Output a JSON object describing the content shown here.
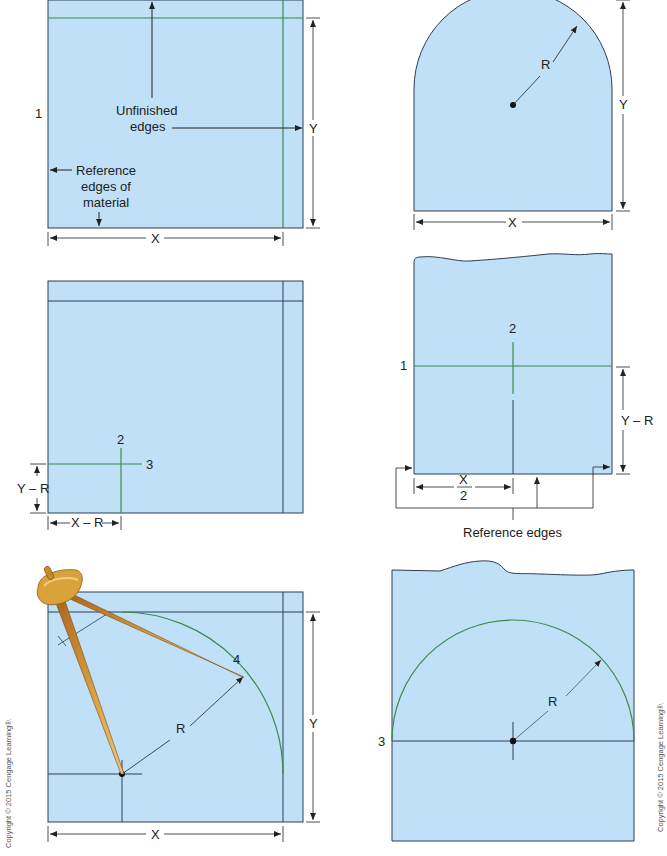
{
  "colors": {
    "material_fill": "#bfe0f7",
    "outline": "#2e3e52",
    "green_line": "#3c8a4e",
    "dim_line": "#222222",
    "compass_gold": "#d9a23a",
    "compass_dark": "#8a5a17"
  },
  "panels": [
    {
      "id": "panel-1",
      "labels": {
        "step": "1",
        "unfinished": "Unfinished",
        "unfinished2": "edges",
        "reference": "Reference",
        "reference2": "edges of",
        "reference3": "material",
        "dim_x": "X",
        "dim_y": "Y"
      }
    },
    {
      "id": "panel-arch",
      "labels": {
        "radius": "R",
        "dim_x": "X",
        "dim_y": "Y"
      }
    },
    {
      "id": "panel-2",
      "labels": {
        "step2": "2",
        "step3": "3",
        "dim_yr": "Y – R",
        "dim_xr": "X – R"
      }
    },
    {
      "id": "panel-centered",
      "labels": {
        "step1": "1",
        "step2": "2",
        "dim_yr": "Y – R",
        "dim_x_num": "X",
        "dim_x_den": "2",
        "reference_edges": "Reference edges"
      }
    },
    {
      "id": "panel-compass",
      "labels": {
        "step4": "4",
        "radius": "R",
        "dim_x": "X",
        "dim_y": "Y"
      }
    },
    {
      "id": "panel-semicircle",
      "labels": {
        "step3": "3",
        "radius": "R"
      }
    }
  ],
  "copyright": {
    "left": "Copyright © 2015 Cengage Learning®.",
    "right": "Copyright © 2015 Cengage Learning®."
  }
}
